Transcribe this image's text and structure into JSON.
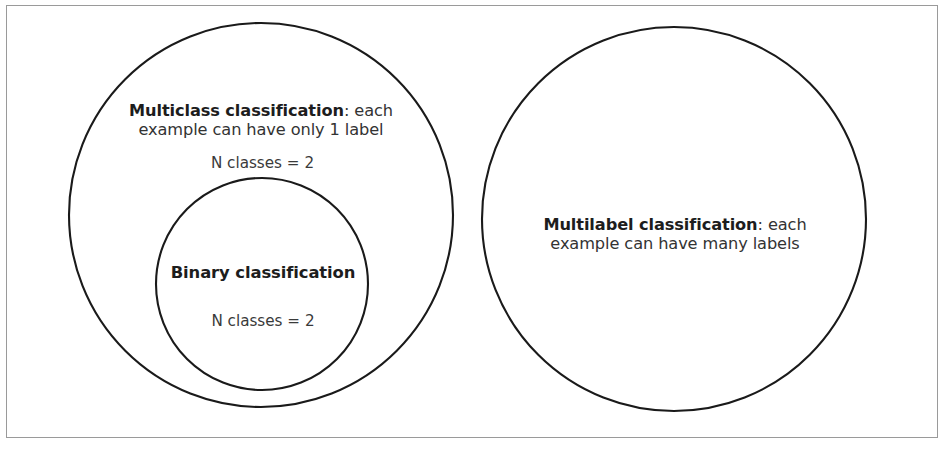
{
  "figure": {
    "background_color": "#ffffff",
    "frame_color": "#9a9a9a",
    "circle_stroke_color": "#1a1a1a",
    "text_color": "#262626"
  },
  "circles": [
    {
      "id": "multiclass",
      "name": "Multiclass classification",
      "cx": 261,
      "cy": 215,
      "r": 192,
      "stroke": "#1a1a1a",
      "stroke_width": 2.1,
      "fill": "none"
    },
    {
      "id": "binary",
      "name": "Binary classification",
      "cx": 262,
      "cy": 284,
      "r": 106,
      "stroke": "#1a1a1a",
      "stroke_width": 2.1,
      "fill": "none"
    },
    {
      "id": "multilabel",
      "name": "Multilabel classification",
      "cx": 674,
      "cy": 219,
      "r": 192,
      "stroke": "#1a1a1a",
      "stroke_width": 2.1,
      "fill": "none"
    }
  ],
  "labels": {
    "multiclass": {
      "title": "Multiclass classification",
      "description": ": each\nexample can have only 1 label",
      "nclasses": "N classes = 2"
    },
    "binary": {
      "title": "Binary classification",
      "nclasses": "N classes = 2"
    },
    "multilabel": {
      "title": "Multilabel classification",
      "description": ": each\nexample can have many labels"
    }
  }
}
